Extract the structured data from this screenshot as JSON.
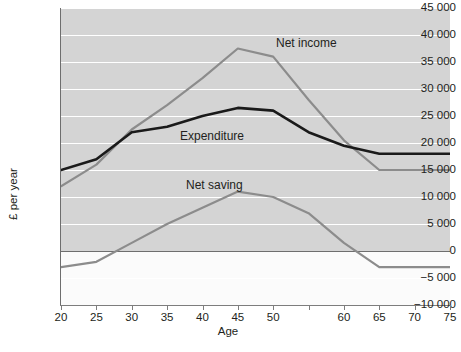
{
  "chart_data": {
    "type": "line",
    "title": "",
    "xlabel": "Age",
    "ylabel": "£ per year",
    "xlim": [
      20,
      75
    ],
    "ylim": [
      -10000,
      45000
    ],
    "grid": true,
    "legend_position": "inline-annotations",
    "x": [
      20,
      25,
      30,
      35,
      40,
      45,
      50,
      55,
      60,
      65,
      70,
      75
    ],
    "xtick_labels": [
      "20",
      "25",
      "30",
      "35",
      "40",
      "45",
      "50",
      "",
      "60",
      "65",
      "70",
      "75"
    ],
    "ytick_values": [
      -10000,
      -5000,
      0,
      5000,
      10000,
      15000,
      20000,
      25000,
      30000,
      35000,
      40000,
      45000
    ],
    "ytick_labels": [
      "−10 000",
      "−5 000",
      "0",
      "5 000",
      "10 000",
      "15 000",
      "20 000",
      "25 000",
      "30 000",
      "35 000",
      "40 000",
      "45 000"
    ],
    "series": [
      {
        "name": "Net income",
        "color": "#8c8c8c",
        "width": 2.2,
        "label": "Net income",
        "values": [
          12000,
          16000,
          22500,
          27000,
          32000,
          37500,
          36000,
          28000,
          20500,
          15000,
          15000,
          15000
        ]
      },
      {
        "name": "Expenditure",
        "color": "#1a1a1a",
        "width": 2.6,
        "label": "Expenditure",
        "values": [
          15000,
          17000,
          22000,
          23000,
          25000,
          26500,
          26000,
          22000,
          19500,
          18000,
          18000,
          18000
        ]
      },
      {
        "name": "Net saving",
        "color": "#8c8c8c",
        "width": 2.2,
        "label": "Net saving",
        "values": [
          -3000,
          -2000,
          1500,
          5000,
          8000,
          11000,
          10000,
          7000,
          1500,
          -3000,
          -3000,
          -3000
        ]
      }
    ]
  },
  "colors": {
    "plot_background": "#d4d4d4",
    "below_zero_background": "#fbfbfb",
    "gridline": "#ffffff",
    "axis": "#6e6e6e",
    "text": "#231f20"
  }
}
